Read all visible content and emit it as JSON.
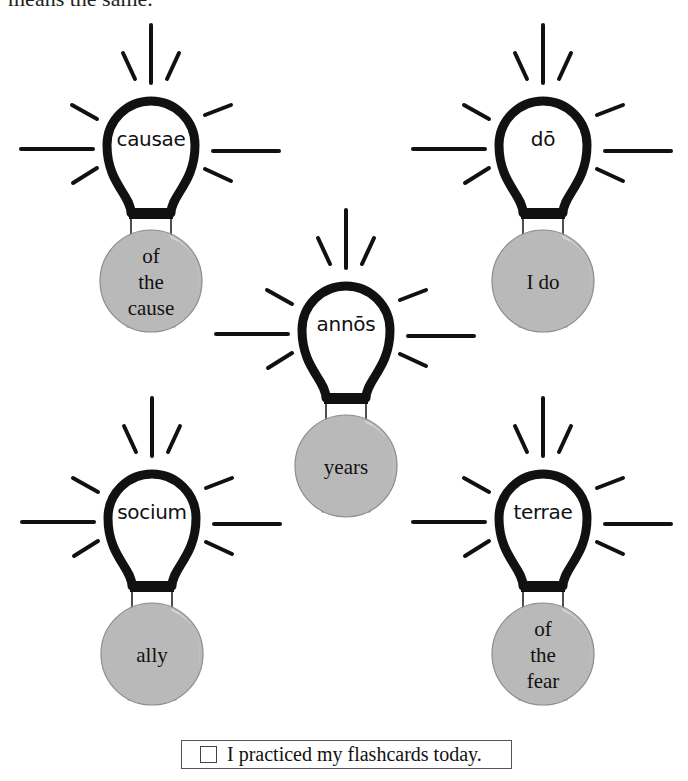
{
  "heading_partial": "means the same.",
  "bulbs": [
    {
      "latin": "causae",
      "english": "of the cause",
      "english_lines": 3
    },
    {
      "latin": "dō",
      "english": "I do",
      "english_lines": 1
    },
    {
      "latin": "annōs",
      "english": "years",
      "english_lines": 1
    },
    {
      "latin": "socium",
      "english": "ally",
      "english_lines": 1
    },
    {
      "latin": "terrae",
      "english": "of the fear",
      "english_lines": 3
    }
  ],
  "practice": {
    "label": "I practiced my flashcards today.",
    "checked": false
  },
  "colors": {
    "outline": "#111111",
    "globe": "#b9b9b9",
    "globe_edge": "#8c8c8c",
    "highlight": "#d6d6d6"
  }
}
